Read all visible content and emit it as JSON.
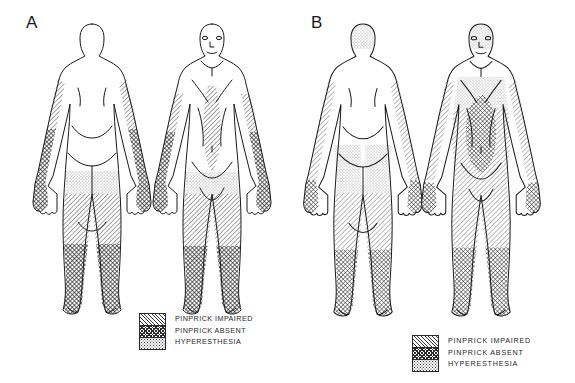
{
  "figure": {
    "background_color": "#ffffff",
    "line_color": "#1a1a1a",
    "panels": [
      {
        "id": "A",
        "label": "A",
        "views": [
          {
            "id": "a-posterior",
            "view": "posterior",
            "sex": "female"
          },
          {
            "id": "a-anterior",
            "view": "anterior",
            "sex": "female"
          }
        ],
        "legend": {
          "entries": [
            {
              "key": "pinprick_impaired",
              "label": "PINPRICK IMPAIRED",
              "pattern": "diagonal-hatch"
            },
            {
              "key": "pinprick_absent",
              "label": "PINPRICK ABSENT",
              "pattern": "cross-hatch"
            },
            {
              "key": "hyperesthesia",
              "label": "HYPERESTHESIA",
              "pattern": "stipple"
            }
          ]
        },
        "regions": {
          "pinprick_impaired": [
            "left-forearm-proximal",
            "right-forearm-proximal",
            "anterior-trunk-midline-stripe",
            "left-thigh",
            "right-thigh"
          ],
          "pinprick_absent": [
            "left-forearm-distal",
            "right-forearm-distal",
            "left-hand",
            "right-hand",
            "left-lower-leg",
            "right-lower-leg",
            "left-foot",
            "right-foot"
          ],
          "hyperesthesia": [
            "lower-abdomen-band",
            "upper-thigh-band",
            "buttock-band"
          ]
        }
      },
      {
        "id": "B",
        "label": "B",
        "views": [
          {
            "id": "b-posterior",
            "view": "posterior",
            "sex": "female"
          },
          {
            "id": "b-anterior",
            "view": "anterior",
            "sex": "female"
          }
        ],
        "legend": {
          "entries": [
            {
              "key": "pinprick_impaired",
              "label": "PINPRICK IMPAIRED",
              "pattern": "diagonal-hatch"
            },
            {
              "key": "pinprick_absent",
              "label": "PINPRICK ABSENT",
              "pattern": "cross-hatch"
            },
            {
              "key": "hyperesthesia",
              "label": "HYPERESTHESIA",
              "pattern": "stipple"
            }
          ]
        },
        "regions": {
          "pinprick_impaired": [
            "left-arm",
            "right-arm",
            "left-thigh",
            "right-thigh",
            "anterior-trunk",
            "scalp"
          ],
          "pinprick_absent": [
            "left-hand",
            "right-hand",
            "left-lower-leg",
            "right-lower-leg",
            "left-foot",
            "right-foot",
            "abdomen-central"
          ],
          "hyperesthesia": [
            "buttock-region",
            "lateral-thigh-band",
            "shoulder-band",
            "chest-band"
          ]
        }
      }
    ]
  }
}
